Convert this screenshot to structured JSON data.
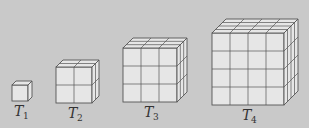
{
  "figure": {
    "background": "#c9c9c9",
    "face_color": "#e6e6e6",
    "line_color": "#555555",
    "cubes": [
      {
        "label": "T",
        "sub": "1",
        "n": 1,
        "x": 12,
        "y": 85,
        "size": 16,
        "depth": 4
      },
      {
        "label": "T",
        "sub": "2",
        "n": 2,
        "x": 56,
        "y": 67,
        "size": 36,
        "depth": 7
      },
      {
        "label": "T",
        "sub": "3",
        "n": 3,
        "x": 123,
        "y": 48,
        "size": 54,
        "depth": 10
      },
      {
        "label": "T",
        "sub": "4",
        "n": 4,
        "x": 212,
        "y": 33,
        "size": 72,
        "depth": 14
      }
    ]
  }
}
